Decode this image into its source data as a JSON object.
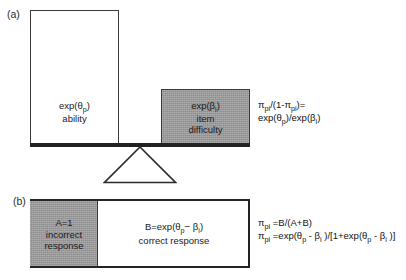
{
  "figure": {
    "panel_a": {
      "label": "(a)",
      "ability_box": {
        "line1": "exp(θp)",
        "line2": "ability"
      },
      "difficulty_box": {
        "line1": "exp(βi)",
        "line2": "item",
        "line3": "difficulty"
      },
      "formula": {
        "line1": "πpi/(1-πpi)=",
        "line2": "exp(θp)/exp(βi)"
      },
      "fulcrum_icon": "triangle-fulcrum-icon"
    },
    "panel_b": {
      "label": "(b)",
      "incorrect_segment": {
        "line1": "A=1",
        "line2": "incorrect",
        "line3": "response"
      },
      "correct_segment": {
        "line1": "B=exp(θp− βi)",
        "line2": "correct response"
      },
      "formula": {
        "line1": "πpi =B/(A+B)",
        "line2": "πpi =exp(θp - βi )/[1+exp(θp - βi )]"
      }
    },
    "colors": {
      "shaded_fill": "#9b9b9b",
      "unshaded_fill": "#ffffff",
      "stroke": "#3a3a3a",
      "beam": "#222222",
      "text": "#1a1a1a"
    }
  }
}
